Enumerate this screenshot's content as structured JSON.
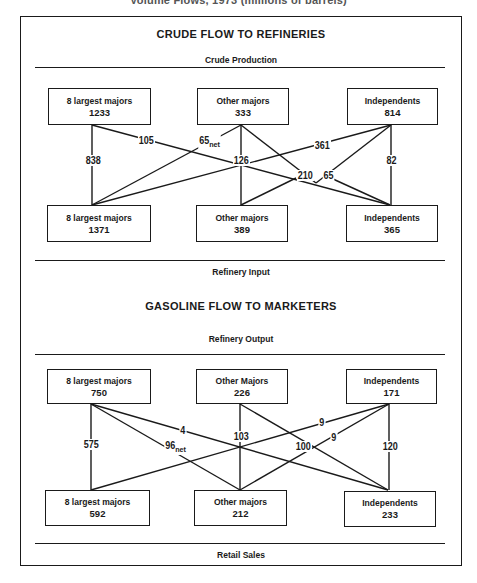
{
  "caption": "Volume Flows, 1973 (millions of barrels)",
  "crude": {
    "heading": "CRUDE FLOW TO REFINERIES",
    "top_label": "Crude Production",
    "bottom_label": "Refinery Input",
    "sources": [
      {
        "name": "8 largest majors",
        "value": "1233"
      },
      {
        "name": "Other majors",
        "value": "333"
      },
      {
        "name": "Independents",
        "value": "814"
      }
    ],
    "destinations": [
      {
        "name": "8 largest majors",
        "value": "1371"
      },
      {
        "name": "Other majors",
        "value": "389"
      },
      {
        "name": "Independents",
        "value": "365"
      }
    ],
    "flows": [
      {
        "from": "8 largest majors",
        "to": "8 largest majors",
        "label": "838"
      },
      {
        "from": "8 largest majors",
        "to": "Independents",
        "label": "105"
      },
      {
        "from": "Other majors",
        "to": "8 largest majors",
        "label": "65",
        "suffix": "net"
      },
      {
        "from": "Other majors",
        "to": "Other majors",
        "label": "126"
      },
      {
        "from": "Independents",
        "to": "8 largest majors",
        "label": "361"
      },
      {
        "from": "Independents",
        "to": "Other majors",
        "label": "210"
      },
      {
        "from": "Other majors",
        "to": "Independents",
        "label": "65"
      },
      {
        "from": "Independents",
        "to": "Independents",
        "label": "82"
      }
    ]
  },
  "gasoline": {
    "heading": "GASOLINE FLOW TO MARKETERS",
    "top_label": "Refinery Output",
    "bottom_label": "Retail Sales",
    "sources": [
      {
        "name": "8 largest majors",
        "value": "750"
      },
      {
        "name": "Other Majors",
        "value": "226"
      },
      {
        "name": "Independents",
        "value": "171"
      }
    ],
    "destinations": [
      {
        "name": "8 largest majors",
        "value": "592"
      },
      {
        "name": "Other majors",
        "value": "212"
      },
      {
        "name": "Independents",
        "value": "233"
      }
    ],
    "flows": [
      {
        "from": "8 largest majors",
        "to": "8 largest majors",
        "label": "575"
      },
      {
        "from": "8 largest majors",
        "to": "Independents",
        "label": "4"
      },
      {
        "from": "8 largest majors",
        "to": "Other majors",
        "label": "96",
        "suffix": "net"
      },
      {
        "from": "Other Majors",
        "to": "Other majors",
        "label": "103"
      },
      {
        "from": "Other Majors",
        "to": "Independents",
        "label": "100"
      },
      {
        "from": "Independents",
        "to": "8 largest majors",
        "label": "9"
      },
      {
        "from": "Independents",
        "to": "Other majors",
        "label": "9"
      },
      {
        "from": "Independents",
        "to": "Independents",
        "label": "120"
      }
    ]
  }
}
